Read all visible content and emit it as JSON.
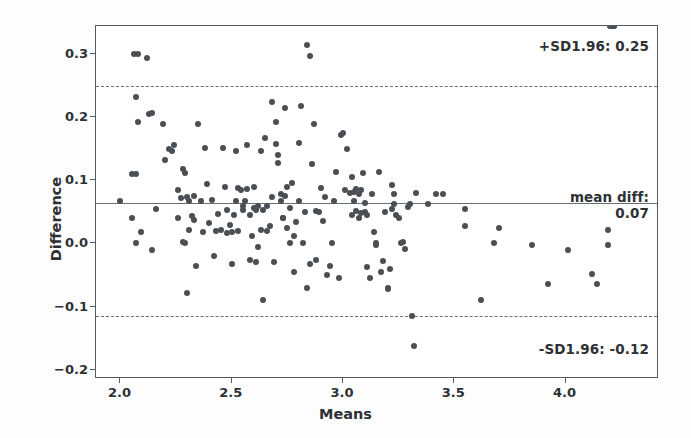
{
  "chart_data": {
    "type": "scatter",
    "title": "",
    "xlabel": "Means",
    "ylabel": "Difference",
    "xlim": [
      1.89,
      4.42
    ],
    "ylim": [
      -0.215,
      0.345
    ],
    "xticks": [
      "2.0",
      "2.5",
      "3.0",
      "3.5",
      "4.0"
    ],
    "xtick_values": [
      2.0,
      2.5,
      3.0,
      3.5,
      4.0
    ],
    "yticks": [
      "0.3",
      "0.2",
      "0.1",
      "0.0",
      "-0.1",
      "-0.2"
    ],
    "ytick_values": [
      0.3,
      0.2,
      0.1,
      0.0,
      -0.1,
      -0.2
    ],
    "grid": false,
    "legend": "none",
    "marker_color": "#4a4f54",
    "line_color": "#6a6f74",
    "reference_lines": [
      {
        "name": "upper-loa",
        "label": "+SD1.96: 0.25",
        "value": 0.25,
        "style": "dashed"
      },
      {
        "name": "mean-diff",
        "label": "mean diff:",
        "label2": "0.07",
        "value": 0.065,
        "style": "solid"
      },
      {
        "name": "lower-loa",
        "label": "-SD1.96: -0.12",
        "value": -0.115,
        "style": "dashed"
      }
    ],
    "annotations": {
      "upper": "+SD1.96: 0.25",
      "mean_line1": "mean diff:",
      "mean_line2": "0.07",
      "lower": "-SD1.96: -0.12"
    },
    "x": [
      2.0,
      2.05,
      2.05,
      2.06,
      2.07,
      2.07,
      2.07,
      2.08,
      2.08,
      2.09,
      2.12,
      2.13,
      2.14,
      2.14,
      2.16,
      2.19,
      2.2,
      2.22,
      2.23,
      2.24,
      2.26,
      2.26,
      2.27,
      2.28,
      2.28,
      2.29,
      2.29,
      2.3,
      2.3,
      2.31,
      2.31,
      2.32,
      2.33,
      2.33,
      2.34,
      2.35,
      2.36,
      2.37,
      2.38,
      2.39,
      2.4,
      2.41,
      2.42,
      2.43,
      2.44,
      2.45,
      2.46,
      2.47,
      2.48,
      2.48,
      2.49,
      2.5,
      2.5,
      2.51,
      2.52,
      2.52,
      2.53,
      2.53,
      2.54,
      2.55,
      2.55,
      2.56,
      2.57,
      2.57,
      2.58,
      2.58,
      2.59,
      2.6,
      2.6,
      2.61,
      2.61,
      2.62,
      2.62,
      2.63,
      2.63,
      2.64,
      2.64,
      2.65,
      2.66,
      2.66,
      2.67,
      2.68,
      2.68,
      2.69,
      2.7,
      2.7,
      2.71,
      2.71,
      2.72,
      2.72,
      2.73,
      2.73,
      2.74,
      2.74,
      2.75,
      2.75,
      2.76,
      2.76,
      2.77,
      2.78,
      2.78,
      2.79,
      2.8,
      2.8,
      2.81,
      2.82,
      2.83,
      2.84,
      2.84,
      2.85,
      2.85,
      2.86,
      2.87,
      2.88,
      2.88,
      2.89,
      2.9,
      2.91,
      2.92,
      2.93,
      2.94,
      2.95,
      2.96,
      2.97,
      2.98,
      2.99,
      3.0,
      3.01,
      3.02,
      3.03,
      3.04,
      3.04,
      3.05,
      3.05,
      3.06,
      3.06,
      3.07,
      3.07,
      3.08,
      3.08,
      3.09,
      3.1,
      3.1,
      3.11,
      3.11,
      3.12,
      3.13,
      3.14,
      3.15,
      3.15,
      3.16,
      3.17,
      3.18,
      3.19,
      3.2,
      3.2,
      3.21,
      3.22,
      3.22,
      3.23,
      3.23,
      3.24,
      3.25,
      3.26,
      3.27,
      3.28,
      3.29,
      3.3,
      3.31,
      3.32,
      3.33,
      3.38,
      3.42,
      3.45,
      3.55,
      3.55,
      3.62,
      3.68,
      3.7,
      3.85,
      3.92,
      4.01,
      4.12,
      4.14,
      4.19,
      4.19,
      4.2,
      4.21,
      4.21,
      4.22,
      4.22
    ],
    "y": [
      0.068,
      0.11,
      0.04,
      0.3,
      0.232,
      0.11,
      0.0,
      0.192,
      0.3,
      0.018,
      0.295,
      0.205,
      0.207,
      -0.01,
      0.055,
      0.19,
      0.133,
      0.15,
      0.146,
      0.156,
      0.085,
      0.04,
      0.072,
      0.002,
      0.118,
      0.112,
      0.0,
      0.073,
      -0.078,
      0.068,
      0.022,
      0.043,
      0.075,
      0.038,
      -0.035,
      0.19,
      0.068,
      0.018,
      0.152,
      0.094,
      0.033,
      0.069,
      -0.02,
      0.02,
      0.047,
      0.022,
      0.152,
      0.09,
      0.017,
      0.053,
      0.03,
      0.018,
      -0.032,
      0.045,
      0.068,
      0.146,
      0.088,
      0.019,
      0.085,
      0.053,
      0.06,
      0.068,
      0.156,
      0.086,
      -0.027,
      0.045,
      0.012,
      0.056,
      0.09,
      0.053,
      -0.03,
      0.06,
      -0.005,
      0.147,
      0.022,
      -0.089,
      0.053,
      0.168,
      0.06,
      0.02,
      0.028,
      0.225,
      0.073,
      -0.03,
      0.192,
      0.158,
      0.14,
      0.128,
      0.068,
      0.078,
      0.04,
      0.04,
      0.215,
      0.075,
      0.024,
      0.09,
      0.0,
      0.057,
      0.096,
      -0.045,
      0.012,
      0.034,
      0.16,
      0.068,
      0.218,
      0.0,
      0.05,
      -0.07,
      0.315,
      0.298,
      -0.033,
      0.126,
      0.19,
      0.052,
      -0.026,
      0.05,
      0.088,
      0.035,
      0.073,
      -0.05,
      -0.035,
      0.0,
      0.068,
      0.113,
      -0.055,
      0.172,
      0.175,
      0.085,
      0.15,
      0.08,
      0.105,
      0.045,
      0.068,
      0.082,
      0.086,
      0.052,
      0.078,
      0.04,
      0.085,
      0.048,
      0.112,
      0.064,
      0.05,
      -0.038,
      0.045,
      -0.055,
      0.078,
      0.018,
      0.0,
      -0.002,
      0.113,
      -0.045,
      -0.028,
      0.05,
      -0.073,
      -0.07,
      -0.04,
      0.055,
      0.092,
      0.078,
      0.063,
      0.045,
      0.04,
      0.0,
      0.002,
      -0.008,
      0.058,
      0.063,
      -0.115,
      -0.163,
      0.08,
      0.062,
      0.078,
      0.078,
      0.055,
      0.028,
      -0.09,
      0.0,
      0.024,
      -0.002,
      -0.065,
      -0.01,
      -0.048,
      -0.065,
      -0.002,
      0.022
    ]
  }
}
